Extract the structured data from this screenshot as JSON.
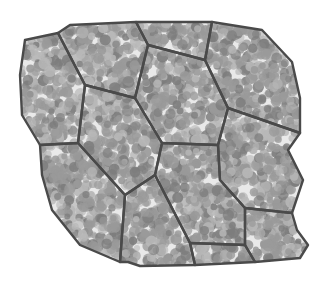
{
  "figure": {
    "title": "",
    "colors": {
      "background": "#ffffff",
      "cell_fill": "#e9e9e9",
      "membrane": "#4a4a4a",
      "granule_dark": "#7d7d7d",
      "granule_mid": "#9a9a9a",
      "granule_light": "#b8b8b8"
    },
    "cells": [
      {
        "id": "cell-1",
        "points": [
          [
            25,
            40
          ],
          [
            58,
            33
          ],
          [
            85,
            85
          ],
          [
            78,
            143
          ],
          [
            40,
            145
          ],
          [
            22,
            115
          ],
          [
            20,
            75
          ]
        ]
      },
      {
        "id": "cell-2",
        "points": [
          [
            58,
            33
          ],
          [
            70,
            25
          ],
          [
            136,
            22
          ],
          [
            148,
            45
          ],
          [
            135,
            98
          ],
          [
            85,
            85
          ]
        ]
      },
      {
        "id": "cell-3",
        "points": [
          [
            136,
            22
          ],
          [
            212,
            22
          ],
          [
            205,
            60
          ],
          [
            148,
            45
          ]
        ]
      },
      {
        "id": "cell-4",
        "points": [
          [
            212,
            22
          ],
          [
            262,
            30
          ],
          [
            292,
            62
          ],
          [
            300,
            98
          ],
          [
            300,
            133
          ],
          [
            228,
            108
          ],
          [
            205,
            60
          ]
        ]
      },
      {
        "id": "cell-5",
        "points": [
          [
            148,
            45
          ],
          [
            205,
            60
          ],
          [
            228,
            108
          ],
          [
            218,
            145
          ],
          [
            162,
            143
          ],
          [
            135,
            98
          ]
        ]
      },
      {
        "id": "cell-6",
        "points": [
          [
            85,
            85
          ],
          [
            135,
            98
          ],
          [
            162,
            143
          ],
          [
            155,
            175
          ],
          [
            125,
            195
          ],
          [
            78,
            143
          ]
        ]
      },
      {
        "id": "cell-7",
        "points": [
          [
            228,
            108
          ],
          [
            300,
            133
          ],
          [
            288,
            150
          ],
          [
            303,
            180
          ],
          [
            292,
            213
          ],
          [
            245,
            208
          ],
          [
            220,
            180
          ],
          [
            218,
            145
          ]
        ]
      },
      {
        "id": "cell-8",
        "points": [
          [
            40,
            145
          ],
          [
            78,
            143
          ],
          [
            125,
            195
          ],
          [
            120,
            262
          ],
          [
            80,
            245
          ],
          [
            52,
            210
          ],
          [
            42,
            175
          ]
        ]
      },
      {
        "id": "cell-9",
        "points": [
          [
            162,
            143
          ],
          [
            218,
            145
          ],
          [
            220,
            180
          ],
          [
            245,
            208
          ],
          [
            245,
            245
          ],
          [
            190,
            243
          ],
          [
            155,
            175
          ]
        ]
      },
      {
        "id": "cell-10",
        "points": [
          [
            125,
            195
          ],
          [
            155,
            175
          ],
          [
            190,
            243
          ],
          [
            195,
            265
          ],
          [
            140,
            266
          ],
          [
            128,
            262
          ],
          [
            120,
            262
          ]
        ]
      },
      {
        "id": "cell-11",
        "points": [
          [
            245,
            208
          ],
          [
            292,
            213
          ],
          [
            297,
            230
          ],
          [
            308,
            245
          ],
          [
            300,
            258
          ],
          [
            255,
            262
          ],
          [
            245,
            245
          ]
        ]
      },
      {
        "id": "cell-12",
        "points": [
          [
            190,
            243
          ],
          [
            245,
            245
          ],
          [
            255,
            262
          ],
          [
            195,
            265
          ]
        ]
      }
    ],
    "granule_count_per_cell": 40,
    "granule_radius_range": [
      3,
      6
    ]
  }
}
